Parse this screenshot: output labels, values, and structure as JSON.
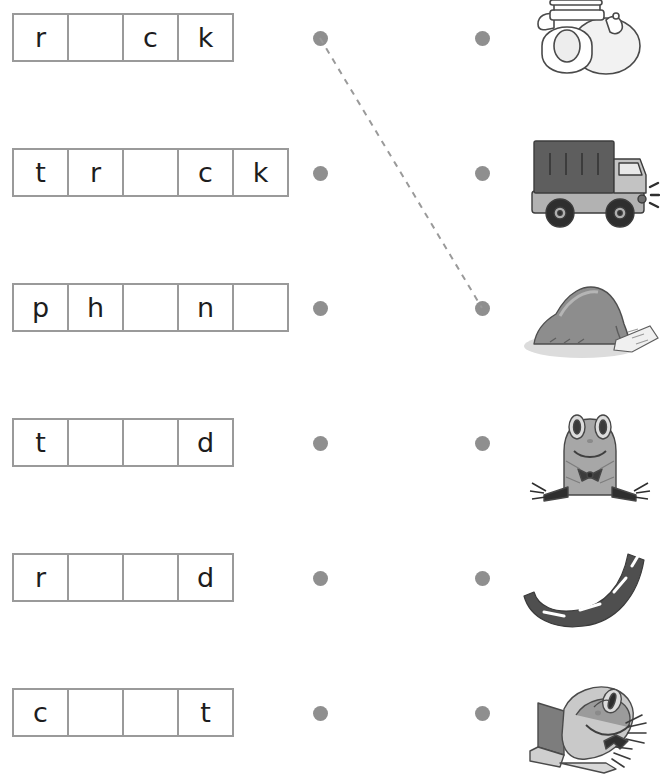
{
  "worksheet": {
    "title": "Missing Vowel Match Worksheet",
    "description": "Fill in the missing letters and draw a line from each word box to the matching picture.",
    "dot_color": "#8f8f8f",
    "box_border_color": "#9a9a9a",
    "letter_color": "#1d1d1d",
    "line_color": "#9a9a9a",
    "line_style": "dashed"
  },
  "rows": [
    {
      "id": "row-1",
      "word": "rock",
      "letters": [
        "r",
        "",
        "c",
        "k"
      ],
      "cell_count": 4,
      "picture": "telephone",
      "picture_label": "phone",
      "left_dot": "dot-row-1-left",
      "right_dot": "dot-row-1-right"
    },
    {
      "id": "row-2",
      "word": "truck",
      "letters": [
        "t",
        "r",
        "",
        "c",
        "k"
      ],
      "cell_count": 5,
      "picture": "truck",
      "picture_label": "truck",
      "left_dot": "dot-row-2-left",
      "right_dot": "dot-row-2-right"
    },
    {
      "id": "row-3",
      "word": "phone",
      "letters": [
        "p",
        "h",
        "",
        "n",
        ""
      ],
      "cell_count": 5,
      "picture": "rock",
      "picture_label": "rock",
      "left_dot": "dot-row-3-left",
      "right_dot": "dot-row-3-right"
    },
    {
      "id": "row-4",
      "word": "toad",
      "letters": [
        "t",
        "",
        "",
        "d"
      ],
      "cell_count": 4,
      "picture": "toad",
      "picture_label": "toad",
      "left_dot": "dot-row-4-left",
      "right_dot": "dot-row-4-right"
    },
    {
      "id": "row-5",
      "word": "road",
      "letters": [
        "r",
        "",
        "",
        "d"
      ],
      "cell_count": 4,
      "picture": "road",
      "picture_label": "road",
      "left_dot": "dot-row-5-left",
      "right_dot": "dot-row-5-right"
    },
    {
      "id": "row-6",
      "word": "coat",
      "letters": [
        "c",
        "",
        "",
        "t"
      ],
      "cell_count": 4,
      "picture": "frog",
      "picture_label": "frog",
      "left_dot": "dot-row-6-left",
      "right_dot": "dot-row-6-right"
    }
  ],
  "drawn_lines": [
    {
      "from_row": 1,
      "to_row": 3,
      "x1": 320,
      "y1": 38,
      "x2": 482,
      "y2": 308
    }
  ]
}
